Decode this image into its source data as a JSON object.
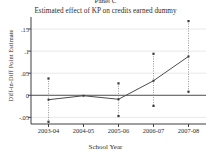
{
  "panel": {
    "label": "Panel C",
    "subtitle": "Estimated effect of  KP on credits earned dummy"
  },
  "axes": {
    "ylabel": "Diff-in-Diff Point Estimate",
    "xlabel": "School Year"
  },
  "ticks": {
    "y": [
      "-.05",
      "0",
      ".05",
      ".1",
      ".15"
    ],
    "x": [
      "2003-04",
      "2004-05",
      "2005-06",
      "2006-07",
      "2007-08"
    ]
  },
  "colors": {
    "line": "#4d4d4d",
    "marker": "#3a3a3a",
    "whisker": "#8c8c8c",
    "zeroline": "#555555",
    "grid": "#d9d9d9",
    "axis": "#3f3f3f",
    "text": "#2a2a2a",
    "background": "#ffffff"
  },
  "chart_data": {
    "type": "line",
    "title": "Panel C",
    "subtitle": "Estimated effect of  KP on credits earned dummy",
    "xlabel": "School Year",
    "ylabel": "Diff-in-Diff Point Estimate",
    "categories": [
      "2003-04",
      "2004-05",
      "2005-06",
      "2006-07",
      "2007-08"
    ],
    "ylim": [
      -0.065,
      0.175
    ],
    "yticks": [
      -0.05,
      0,
      0.05,
      0.1,
      0.15
    ],
    "ytick_labels": [
      "-.05",
      "0",
      ".05",
      ".1",
      ".15"
    ],
    "grid": "horizontal",
    "legend": "none",
    "reference_line": {
      "y": 0,
      "style": "solid"
    },
    "series": [
      {
        "name": "Diff-in-Diff Point Estimate",
        "values": [
          -0.01,
          -0.001,
          -0.009,
          0.033,
          0.088
        ],
        "errorbars": {
          "type": "confidence-interval",
          "lower": [
            -0.06,
            -0.001,
            -0.047,
            -0.024,
            0.008
          ],
          "upper": [
            0.038,
            -0.001,
            0.027,
            0.094,
            0.168
          ]
        }
      }
    ]
  }
}
